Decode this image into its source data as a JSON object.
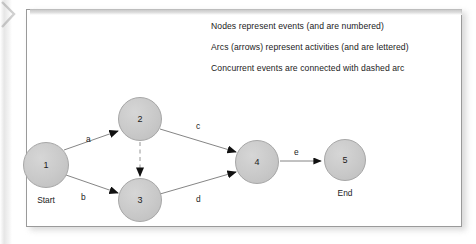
{
  "page": {
    "background_color": "#ffffff",
    "card_color": "#ffffff",
    "card_border_color": "#9a9a9a"
  },
  "legend": {
    "lines": [
      "Nodes represent events (and are numbered)",
      "Arcs (arrows) represent activities (and are lettered)",
      "Concurrent events are connected with dashed arc"
    ]
  },
  "diagram": {
    "type": "activity-on-arc-network",
    "node_fill_color": "#c9c9c9",
    "node_border_color": "#a6a6a6",
    "arc_color": "#6e6e6e",
    "nodes": [
      {
        "id": "1",
        "label": "1",
        "caption": "Start",
        "cx": 46,
        "cy": 165,
        "r": 23
      },
      {
        "id": "2",
        "label": "2",
        "caption": "",
        "cx": 140,
        "cy": 119,
        "r": 22
      },
      {
        "id": "3",
        "label": "3",
        "caption": "",
        "cx": 140,
        "cy": 200,
        "r": 22
      },
      {
        "id": "4",
        "label": "4",
        "caption": "",
        "cx": 257,
        "cy": 162,
        "r": 22
      },
      {
        "id": "5",
        "label": "5",
        "caption": "End",
        "cx": 345,
        "cy": 160,
        "r": 21
      }
    ],
    "arcs": [
      {
        "id": "a",
        "label": "a",
        "from": "1",
        "to": "2",
        "style": "solid",
        "label_x": 86,
        "label_y": 141
      },
      {
        "id": "b",
        "label": "b",
        "from": "1",
        "to": "3",
        "style": "solid",
        "label_x": 81,
        "label_y": 198
      },
      {
        "id": "c",
        "label": "c",
        "from": "2",
        "to": "4",
        "style": "solid",
        "label_x": 197,
        "label_y": 127
      },
      {
        "id": "d",
        "label": "d",
        "from": "3",
        "to": "4",
        "style": "solid",
        "label_x": 197,
        "label_y": 200
      },
      {
        "id": "e",
        "label": "e",
        "from": "4",
        "to": "5",
        "style": "solid",
        "label_x": 295,
        "label_y": 153
      },
      {
        "id": "dummy",
        "label": "",
        "from": "2",
        "to": "3",
        "style": "dashed",
        "label_x": 0,
        "label_y": 0
      }
    ]
  }
}
